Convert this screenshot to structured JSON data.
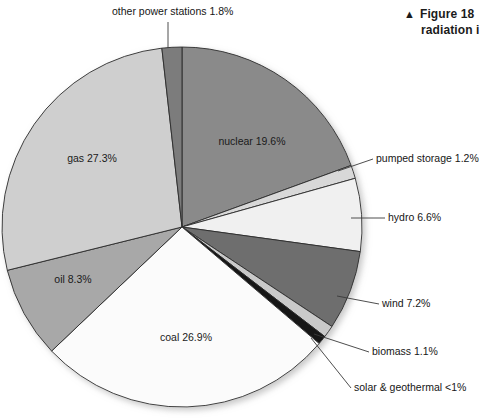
{
  "caption": {
    "marker_icon": "up-triangle-icon",
    "marker": "▲",
    "line1": "Figure 18",
    "line2": "radiation i"
  },
  "chart_data": {
    "type": "pie",
    "title": "",
    "unit": "%",
    "legend_position": "inline-labels",
    "categories": [
      "nuclear",
      "pumped storage",
      "hydro",
      "wind",
      "biomass",
      "solar & geothermal",
      "coal",
      "oil",
      "gas",
      "other power stations"
    ],
    "values": [
      19.6,
      1.2,
      6.6,
      7.2,
      1.1,
      0.8,
      26.9,
      8.3,
      27.3,
      1.8
    ],
    "labels": [
      "nuclear 19.6%",
      "pumped storage 1.2%",
      "hydro 6.6%",
      "wind 7.2%",
      "biomass 1.1%",
      "solar & geothermal <1%",
      "coal 26.9%",
      "oil 8.3%",
      "gas 27.3%",
      "other power stations 1.8%"
    ],
    "colors": [
      "#8a8a8a",
      "#d8d8d8",
      "#f0f0f0",
      "#6e6e6e",
      "#c9c9c9",
      "#141414",
      "#fbfbfb",
      "#a8a8a8",
      "#cfcfcf",
      "#7b7b7b"
    ],
    "slice_label_placement": [
      "inside",
      "callout-right",
      "callout-right",
      "callout-right",
      "callout-right",
      "callout-right",
      "inside",
      "inside",
      "inside",
      "callout-top"
    ],
    "outline_color": "#2b2b2b",
    "start_angle_deg": -90,
    "direction": "clockwise"
  },
  "pie_geometry": {
    "cx": 182,
    "cy": 227,
    "r": 180
  },
  "inside_labels": [
    {
      "key": "nuclear",
      "text": "nuclear 19.6%",
      "x": 252,
      "y": 145
    },
    {
      "key": "gas",
      "text": "gas 27.3%",
      "x": 92,
      "y": 162
    },
    {
      "key": "oil",
      "text": "oil 8.3%",
      "x": 73,
      "y": 283
    },
    {
      "key": "coal",
      "text": "coal 26.9%",
      "x": 186,
      "y": 341
    }
  ],
  "callout_labels": [
    {
      "key": "other-power-stations",
      "text": "other power stations 1.8%",
      "x": 112,
      "y": 15,
      "anchor": "start"
    },
    {
      "key": "pumped-storage",
      "text": "pumped storage 1.2%",
      "x": 376,
      "y": 162,
      "anchor": "start"
    },
    {
      "key": "hydro",
      "text": "hydro 6.6%",
      "x": 388,
      "y": 221,
      "anchor": "start"
    },
    {
      "key": "wind",
      "text": "wind 7.2%",
      "x": 382,
      "y": 307,
      "anchor": "start"
    },
    {
      "key": "biomass",
      "text": "biomass 1.1%",
      "x": 372,
      "y": 355,
      "anchor": "start"
    },
    {
      "key": "solar-geothermal",
      "text": "solar & geothermal <1%",
      "x": 354,
      "y": 391,
      "anchor": "start"
    }
  ]
}
